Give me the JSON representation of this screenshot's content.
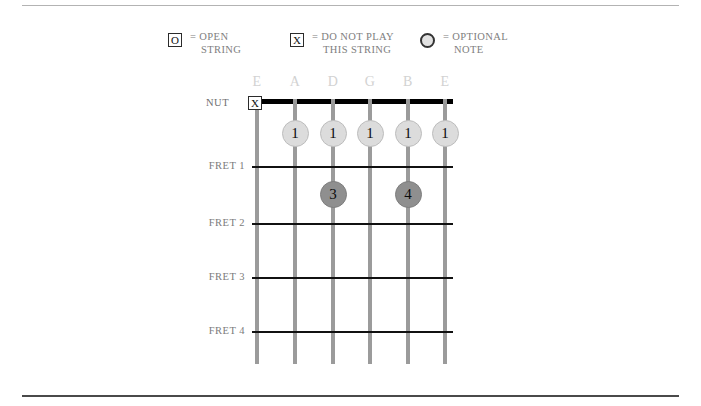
{
  "rules": {
    "top": "",
    "bottom": ""
  },
  "legend": {
    "items": [
      {
        "glyph": "O",
        "glyph_name": "open-string-box-icon",
        "line1": "= OPEN",
        "line2": "STRING"
      },
      {
        "glyph": "X",
        "glyph_name": "do-not-play-box-icon",
        "line1": "= DO NOT PLAY",
        "line2": "THIS STRING"
      },
      {
        "glyph": "",
        "glyph_name": "optional-note-circle-icon",
        "line1": "= OPTIONAL",
        "line2": "NOTE"
      }
    ]
  },
  "diagram": {
    "nut_label": "NUT",
    "mute_marker": "X",
    "mute_marker_string": "E",
    "string_labels": [
      "E",
      "A",
      "D",
      "G",
      "B",
      "E"
    ],
    "fret_labels": [
      "FRET 1",
      "FRET 2",
      "FRET 3",
      "FRET 4"
    ],
    "finger_positions": [
      {
        "string": "A",
        "fret": 1,
        "finger": "1",
        "style": "light"
      },
      {
        "string": "D",
        "fret": 1,
        "finger": "1",
        "style": "light"
      },
      {
        "string": "G",
        "fret": 1,
        "finger": "1",
        "style": "light"
      },
      {
        "string": "B",
        "fret": 1,
        "finger": "1",
        "style": "light"
      },
      {
        "string": "E",
        "fret": 1,
        "finger": "1",
        "style": "light"
      },
      {
        "string": "D",
        "fret": 2,
        "finger": "3",
        "style": "dark"
      },
      {
        "string": "B",
        "fret": 2,
        "finger": "4",
        "style": "dark"
      }
    ]
  },
  "colors": {
    "nut": "#000000",
    "string": "#9b9b9b",
    "fret_line": "#111111",
    "dot_light": "#dcdcdc",
    "dot_dark": "#8f8f8f",
    "label_gray": "#7b7b7b",
    "string_label_gray": "#d2d2d2"
  }
}
